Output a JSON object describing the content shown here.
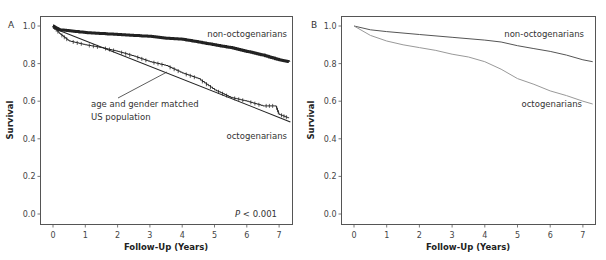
{
  "chart_data": [
    {
      "panel": "A",
      "type": "line",
      "xlabel": "Follow-Up (Years)",
      "ylabel": "Survival",
      "xlim": [
        -0.4,
        7.4
      ],
      "ylim": [
        -0.05,
        1.05
      ],
      "xticks": [
        0,
        1,
        2,
        3,
        4,
        5,
        6,
        7
      ],
      "yticks": [
        "0.0",
        "0.2",
        "0.4",
        "0.6",
        "0.8",
        "1.0"
      ],
      "grid": false,
      "annotations": [
        "non-octogenarians",
        "octogenarians",
        "age and gender matched",
        "US population",
        "P < 0.001"
      ],
      "series": [
        {
          "name": "non-octogenarians",
          "style": "step, heavy censor marks",
          "x": [
            0,
            0.2,
            0.5,
            1,
            1.5,
            2,
            2.5,
            3,
            3.5,
            4,
            4.5,
            5,
            5.5,
            6,
            6.5,
            7,
            7.3
          ],
          "values": [
            1.0,
            0.98,
            0.975,
            0.965,
            0.96,
            0.955,
            0.95,
            0.945,
            0.935,
            0.93,
            0.915,
            0.9,
            0.885,
            0.865,
            0.845,
            0.82,
            0.81
          ]
        },
        {
          "name": "octogenarians",
          "style": "step with censor marks",
          "x": [
            0,
            0.2,
            0.5,
            1,
            1.5,
            2,
            2.5,
            3,
            3.5,
            4,
            4.5,
            5,
            5.5,
            6,
            6.5,
            6.9,
            7.0,
            7.3
          ],
          "values": [
            1.0,
            0.96,
            0.92,
            0.9,
            0.885,
            0.865,
            0.84,
            0.81,
            0.79,
            0.75,
            0.72,
            0.66,
            0.62,
            0.6,
            0.575,
            0.575,
            0.53,
            0.51
          ]
        },
        {
          "name": "age and gender matched US population",
          "style": "straight line",
          "x": [
            0,
            7.35
          ],
          "values": [
            0.99,
            0.49
          ]
        }
      ]
    },
    {
      "panel": "B",
      "type": "line",
      "xlabel": "Follow-Up (Years)",
      "ylabel": "Survival",
      "xlim": [
        -0.4,
        7.4
      ],
      "ylim": [
        -0.05,
        1.05
      ],
      "xticks": [
        0,
        1,
        2,
        3,
        4,
        5,
        6,
        7
      ],
      "yticks": [
        "0.0",
        "0.2",
        "0.4",
        "0.6",
        "0.8",
        "1.0"
      ],
      "grid": false,
      "annotations": [
        "non-octogenarians",
        "octogenarians"
      ],
      "series": [
        {
          "name": "non-octogenarians",
          "color": "#555555",
          "x": [
            0,
            0.5,
            1,
            2,
            3,
            4,
            4.5,
            5,
            5.5,
            6,
            6.5,
            7,
            7.3
          ],
          "values": [
            1.0,
            0.98,
            0.97,
            0.955,
            0.94,
            0.925,
            0.915,
            0.895,
            0.88,
            0.865,
            0.845,
            0.82,
            0.81
          ]
        },
        {
          "name": "octogenarians",
          "color": "#999999",
          "x": [
            0,
            0.5,
            1,
            1.5,
            2,
            2.5,
            3,
            3.5,
            4,
            4.5,
            5,
            5.5,
            6,
            6.5,
            7,
            7.3
          ],
          "values": [
            1.0,
            0.95,
            0.92,
            0.9,
            0.885,
            0.87,
            0.85,
            0.835,
            0.81,
            0.77,
            0.72,
            0.69,
            0.655,
            0.63,
            0.6,
            0.585
          ]
        }
      ]
    }
  ],
  "panels": {
    "a": {
      "label": "A",
      "ylabel": "Survival",
      "xlabel": "Follow-Up (Years)",
      "yticks": [
        "1.0",
        "0.8",
        "0.6",
        "0.4",
        "0.2",
        "0.0"
      ],
      "xticks": [
        "0",
        "1",
        "2",
        "3",
        "4",
        "5",
        "6",
        "7"
      ],
      "label_non_octo": "non-octogenarians",
      "label_octo": "octogenarians",
      "annot_line1": "age and gender matched",
      "annot_line2": "US population",
      "pvalue_italic": "P",
      "pvalue_rest": " < 0.001"
    },
    "b": {
      "label": "B",
      "ylabel": "Survival",
      "xlabel": "Follow-Up (Years)",
      "yticks": [
        "1.0",
        "0.8",
        "0.6",
        "0.4",
        "0.2",
        "0.0"
      ],
      "xticks": [
        "0",
        "1",
        "2",
        "3",
        "4",
        "5",
        "6",
        "7"
      ],
      "label_non_octo": "non-octogenarians",
      "label_octo": "octogenarians"
    }
  },
  "colors": {
    "ink": "#222222",
    "non_octo_b": "#555555",
    "octo_b": "#9a9a9a",
    "frame": "#555555"
  }
}
